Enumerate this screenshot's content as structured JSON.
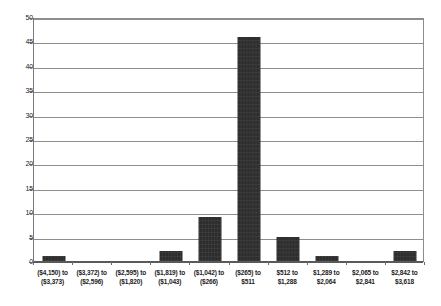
{
  "chart_data": {
    "type": "bar",
    "title": "",
    "subtitle": "",
    "xlabel": "",
    "ylabel": "",
    "ylim": [
      0,
      50
    ],
    "ytick_step": 5,
    "yticks": [
      0,
      5,
      10,
      15,
      20,
      25,
      30,
      35,
      40,
      45,
      50
    ],
    "grid": true,
    "legend": false,
    "legend_position": "none",
    "bar_color": "#2d2d2d",
    "gridline_color": "#8e8e8e",
    "background_color": "#ffffff",
    "categories": [
      "($4,150) to ($3,373)",
      "($3,372) to ($2,596)",
      "($2,595) to ($1,820)",
      "($1,819) to ($1,043)",
      "($1,042) to ($266)",
      "($265) to $511",
      "$512 to $1,288",
      "$1,289 to $2,064",
      "$2,065 to $2,841",
      "$2,842 to $3,618"
    ],
    "category_lines": [
      [
        "($4,150) to",
        "($3,373)"
      ],
      [
        "($3,372) to",
        "($2,596)"
      ],
      [
        "($2,595) to",
        "($1,820)"
      ],
      [
        "($1,819) to",
        "($1,043)"
      ],
      [
        "($1,042) to",
        "($266)"
      ],
      [
        "($265) to",
        "$511"
      ],
      [
        "$512 to",
        "$1,288"
      ],
      [
        "$1,289 to",
        "$2,064"
      ],
      [
        "$2,065 to",
        "$2,841"
      ],
      [
        "$2,842 to",
        "$3,618"
      ]
    ],
    "values": [
      1,
      0,
      0,
      2,
      9,
      46,
      5,
      1,
      0,
      2
    ]
  }
}
